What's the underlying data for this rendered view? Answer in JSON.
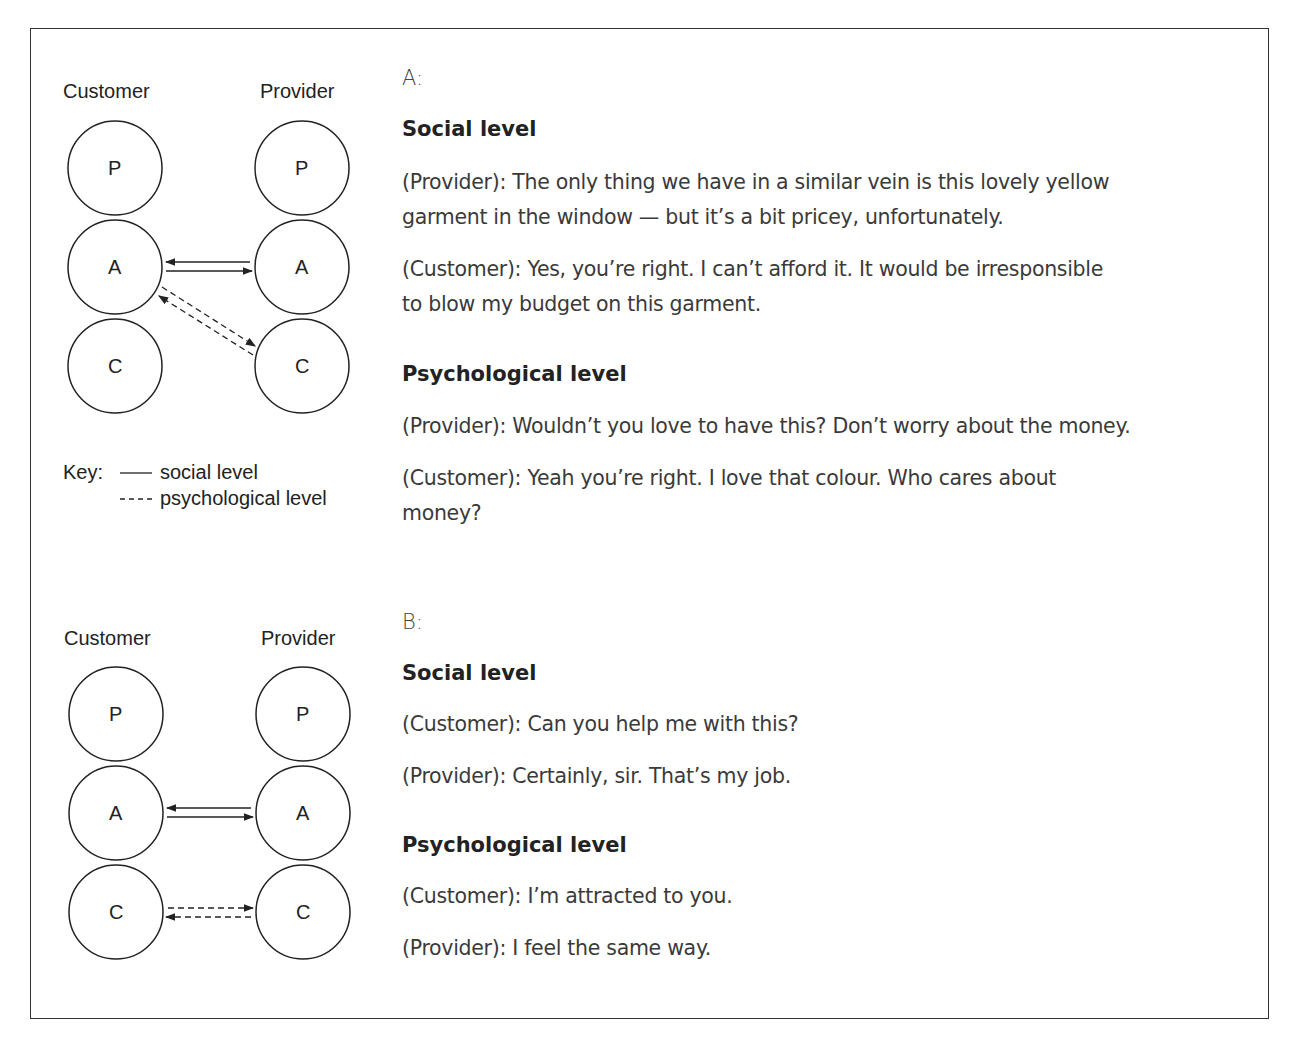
{
  "figure": {
    "panel_a": {
      "label": "A:",
      "diagram": {
        "left_title": "Customer",
        "right_title": "Provider",
        "left_states": [
          "P",
          "A",
          "C"
        ],
        "right_states": [
          "P",
          "A",
          "C"
        ],
        "social_arrows": "Customer A <-> Provider A (solid, both directions)",
        "psychological_arrows": "Customer A <-> Provider C (dashed, diagonal, both directions)"
      },
      "key": {
        "title": "Key:",
        "social": "social level",
        "psychological": "psychological level"
      },
      "social_heading": "Social level",
      "social_lines": [
        {
          "speaker": "(Provider):",
          "text": "The only thing we have in a similar vein is this lovely yellow",
          "cont": "garment in the window — but it’s a bit pricey, unfortunately."
        },
        {
          "speaker": "(Customer):",
          "text": "Yes, you’re right. I can’t afford it. It would be irresponsible",
          "cont": "to blow my budget on this garment."
        }
      ],
      "psych_heading": "Psychological level",
      "psych_lines": [
        {
          "speaker": "(Provider):",
          "text": "Wouldn’t you love to have this? Don’t worry about the money."
        },
        {
          "speaker": "(Customer):",
          "text": "Yeah you’re right. I love that colour. Who cares about",
          "cont": "money?"
        }
      ]
    },
    "panel_b": {
      "label": "B:",
      "diagram": {
        "left_title": "Customer",
        "right_title": "Provider",
        "left_states": [
          "P",
          "A",
          "C"
        ],
        "right_states": [
          "P",
          "A",
          "C"
        ],
        "social_arrows": "Customer A <-> Provider A (solid, both directions)",
        "psychological_arrows": "Customer C <-> Provider C (dashed, horizontal, both directions)"
      },
      "social_heading": "Social level",
      "social_lines": [
        {
          "speaker": "(Customer):",
          "text": "Can you help me with this?"
        },
        {
          "speaker": "(Provider):",
          "text": "Certainly, sir. That’s my job."
        }
      ],
      "psych_heading": "Psychological level",
      "psych_lines": [
        {
          "speaker": "(Customer):",
          "text": "I’m attracted to you."
        },
        {
          "speaker": "(Provider):",
          "text": "I feel the same way."
        }
      ]
    }
  }
}
